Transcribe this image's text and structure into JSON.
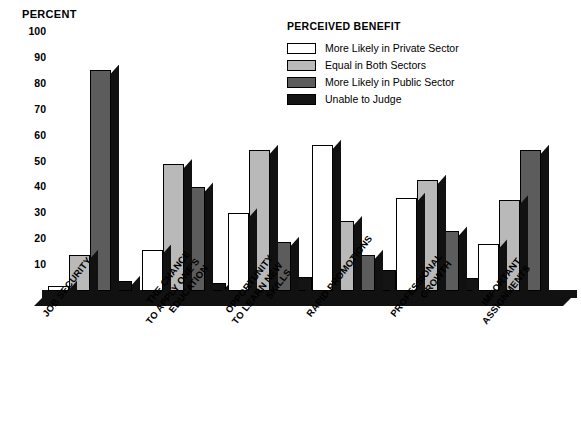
{
  "chart_data": {
    "type": "bar",
    "title": "",
    "ylabel": "PERCENT",
    "xlabel": "",
    "ylim": [
      0,
      100
    ],
    "yticks": [
      100,
      90,
      80,
      70,
      60,
      50,
      40,
      30,
      20,
      10
    ],
    "grid": false,
    "legend_position": "top-right",
    "legend_title": "PERCEIVED BENEFIT",
    "categories": [
      "JOB SECURITY",
      "THE CHANCE\nTO APPLY ONE'S\nEDUCATION",
      "OPPORTUNITY\nTO LEARN NEW\nSKILLS",
      "RAPID PROMOTIONS",
      "PROFESSIONAL\nGROWTH",
      "IMPORTANT\nASSIGNMENTS"
    ],
    "series": [
      {
        "name": "More Likely in Private Sector",
        "color": "#ffffff",
        "values": [
          2,
          16,
          30,
          56.5,
          36,
          18
        ]
      },
      {
        "name": "Equal in Both Sectors",
        "color": "#b9b9b9",
        "values": [
          14,
          49,
          54.5,
          27,
          43,
          35
        ]
      },
      {
        "name": "More Likely in Public Sector",
        "color": "#5c5c5c",
        "values": [
          85.5,
          40,
          19,
          14,
          23,
          54.5
        ]
      },
      {
        "name": "Unable to Judge",
        "color": "#141414",
        "values": [
          4,
          3,
          5.5,
          8,
          5,
          0
        ]
      }
    ]
  },
  "category_lines": [
    [
      "JOB SECURITY"
    ],
    [
      "THE CHANCE",
      "TO APPLY ONE'S",
      "EDUCATION"
    ],
    [
      "OPPORTUNITY",
      "TO LEARN NEW",
      "SKILLS"
    ],
    [
      "RAPID PROMOTIONS"
    ],
    [
      "PROFESSIONAL",
      "GROWTH"
    ],
    [
      "IMPORTANT",
      "ASSIGNMENTS"
    ]
  ]
}
